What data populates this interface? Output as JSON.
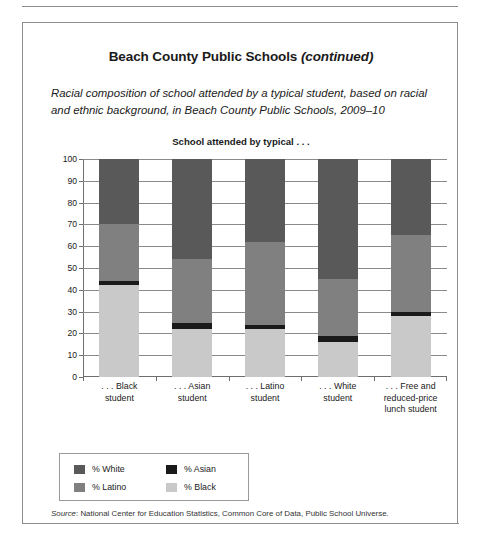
{
  "document": {
    "title_main": "Beach County Public Schools ",
    "title_continued": "(continued)",
    "subtitle": "Racial composition of school attended by a typical student, based on racial and ethnic background, in Beach County Public Schools, 2009–10",
    "source_label": "Source",
    "source_text": ": National Center for Education Statistics, Common Core of Data, Public School Universe."
  },
  "chart_data": {
    "type": "bar",
    "stacked": true,
    "title": "School attended by typical . . .",
    "xlabel": "",
    "ylabel": "",
    "ylim": [
      0,
      100
    ],
    "ytick_step": 10,
    "grid": true,
    "legend_position": "below-left",
    "categories": [
      ". . . Black\nstudent",
      ". . . Asian\nstudent",
      ". . . Latino\nstudent",
      ". . . White\nstudent",
      ". . . Free and\nreduced-price\nlunch student"
    ],
    "category_lines": [
      [
        ". . . Black",
        "student"
      ],
      [
        ". . . Asian",
        "student"
      ],
      [
        ". . . Latino",
        "student"
      ],
      [
        ". . . White",
        "student"
      ],
      [
        ". . . Free and",
        "reduced-price",
        "lunch student"
      ]
    ],
    "yticks": [
      "100",
      "90",
      "80",
      "70",
      "60",
      "50",
      "40",
      "30",
      "20",
      "10",
      "0"
    ],
    "series": [
      {
        "name": "% Black",
        "color": "#c9c9c9",
        "values": [
          42,
          22,
          22,
          16,
          28
        ]
      },
      {
        "name": "% Asian",
        "color": "#1a1a1a",
        "values": [
          2,
          3,
          2,
          3,
          2
        ]
      },
      {
        "name": "% Latino",
        "color": "#808080",
        "values": [
          26,
          29,
          38,
          26,
          35
        ]
      },
      {
        "name": "% White",
        "color": "#595959",
        "values": [
          30,
          46,
          38,
          55,
          35
        ]
      }
    ],
    "legend_entries": [
      {
        "label": "% White",
        "color": "#595959"
      },
      {
        "label": "% Asian",
        "color": "#1a1a1a"
      },
      {
        "label": "% Latino",
        "color": "#808080"
      },
      {
        "label": "% Black",
        "color": "#c9c9c9"
      }
    ]
  }
}
